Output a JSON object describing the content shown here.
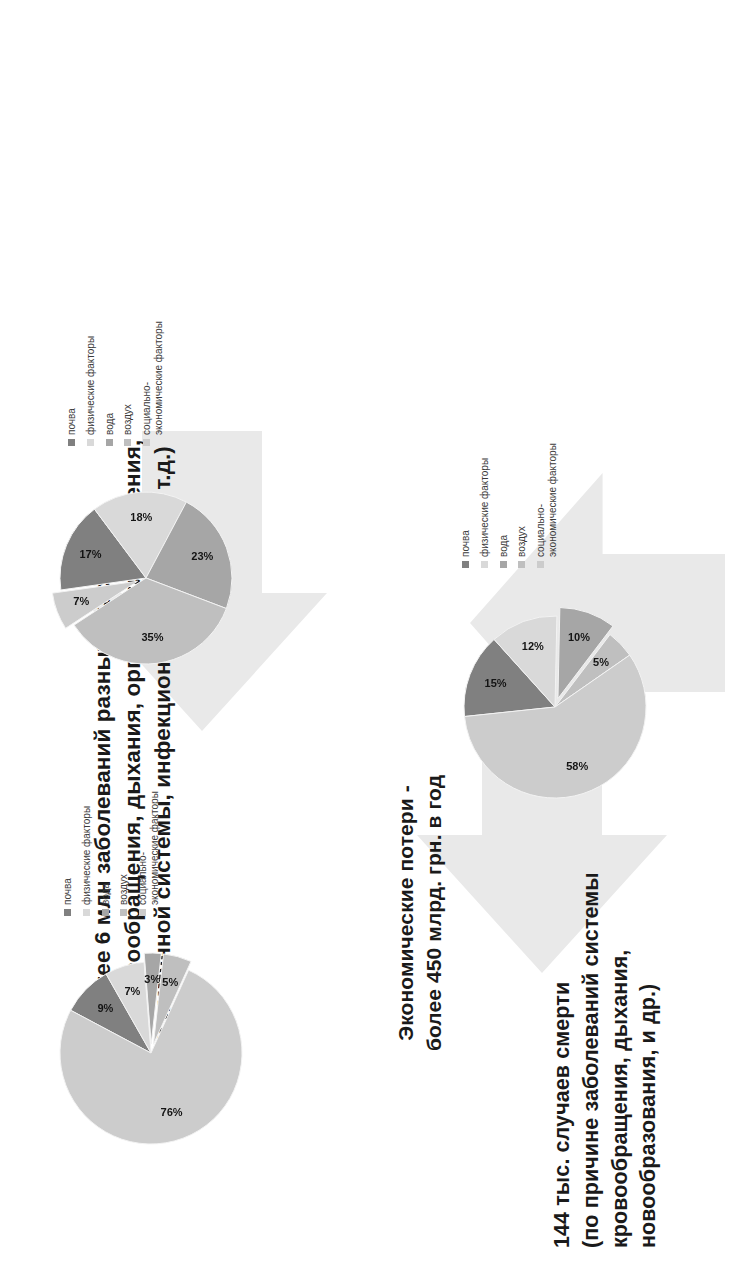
{
  "slide": {
    "background_color": "#ffffff",
    "arrow_color": "#e9e9e9"
  },
  "title": {
    "line1": "Более 6 млн заболеваний разных классов",
    "line2": "(органов кровообращения, дыхания, органов пищеварения,",
    "line3": "крови и иммунной системы, инфекционные болезни и т.д.)"
  },
  "economic": {
    "line1": "Экономические потери -",
    "line2": "более 450 млрд. грн. в год"
  },
  "deaths": {
    "line1": "144 тыс. случаев смерти",
    "line2": "(по причине заболеваний системы",
    "line3": "кровообращения, дыхания,",
    "line4": "новообразования, и др.)"
  },
  "legend_labels": {
    "soil": "почва",
    "physical": "физические факторы",
    "water": "вода",
    "air": "воздух",
    "socio": "социально-\nэкономические факторы"
  },
  "palette": {
    "soil": "#808080",
    "physical": "#d9d9d9",
    "water": "#a6a6a6",
    "air": "#bfbfbf",
    "socio": "#cccccc"
  },
  "chart_data": [
    {
      "id": "diseases-pie",
      "type": "pie",
      "title": "Более 6 млн заболеваний разных классов",
      "categories": [
        "почва",
        "физические факторы",
        "вода",
        "воздух",
        "социально-экономические факторы"
      ],
      "values": [
        15,
        12,
        10,
        5,
        58
      ],
      "labels": [
        "15%",
        "12%",
        "10%",
        "5%",
        "58%"
      ],
      "colors": [
        "#808080",
        "#d9d9d9",
        "#a6a6a6",
        "#bfbfbf",
        "#cccccc"
      ],
      "exploded": [
        "вода"
      ],
      "legend_position": "right"
    },
    {
      "id": "mortality-pie",
      "type": "pie",
      "title": "144 тыс. случаев смерти",
      "categories": [
        "почва",
        "физические факторы",
        "вода",
        "воздух",
        "социально-экономические факторы"
      ],
      "values": [
        17,
        18,
        23,
        35,
        7
      ],
      "labels": [
        "17%",
        "18%",
        "23%",
        "35%",
        "7%"
      ],
      "colors": [
        "#808080",
        "#d9d9d9",
        "#a6a6a6",
        "#bfbfbf",
        "#cccccc"
      ],
      "exploded": [
        "социально-экономические факторы"
      ],
      "legend_position": "right"
    },
    {
      "id": "economic-losses-pie",
      "type": "pie",
      "title": "Экономические потери - более 450 млрд. грн. в год",
      "categories": [
        "почва",
        "физические факторы",
        "вода",
        "воздух",
        "социально-экономические факторы"
      ],
      "values": [
        9,
        7,
        3,
        5,
        76
      ],
      "labels": [
        "9%",
        "7%",
        "3%",
        "5%",
        "76%"
      ],
      "colors": [
        "#808080",
        "#d9d9d9",
        "#a6a6a6",
        "#bfbfbf",
        "#cccccc"
      ],
      "exploded": [
        "вода",
        "воздух"
      ],
      "legend_position": "right"
    }
  ]
}
